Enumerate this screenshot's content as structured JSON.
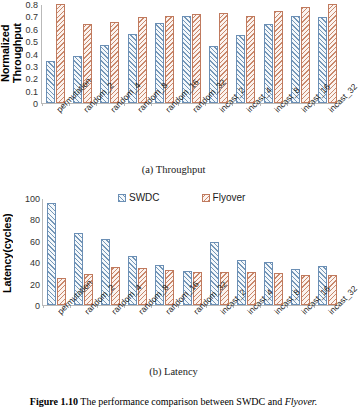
{
  "figure": {
    "caption_label": "Figure 1.10",
    "caption_text": "The performance comparison between SWDC and",
    "caption_emphasis": "Flyover."
  },
  "legend": {
    "items": [
      {
        "label": "SWDC",
        "color": "#6b8fb5"
      },
      {
        "label": "Flyover",
        "color": "#c07a5e"
      }
    ]
  },
  "panels": [
    {
      "subcaption": "(a) Throughput"
    },
    {
      "subcaption": "(b) Latency"
    }
  ],
  "chart_data": [
    {
      "type": "bar",
      "title": "(a) Throughput",
      "xlabel": "",
      "ylabel": "Normalized Throughput",
      "ylim": [
        0,
        0.8
      ],
      "yticks": [
        0,
        0.1,
        0.2,
        0.3,
        0.4,
        0.5,
        0.6,
        0.7,
        0.8
      ],
      "yticklabels": [
        "0",
        "0.1",
        "0.2",
        "0.3",
        "0.4",
        "0.5",
        "0.6",
        "0.7",
        "0.8"
      ],
      "grid": false,
      "legend_position": "none",
      "categories": [
        "permutation",
        "random_2",
        "random_4",
        "random_8",
        "random_16",
        "random_32",
        "incast_2",
        "incast_4",
        "incast_8",
        "incast_16",
        "incast_32"
      ],
      "series": [
        {
          "name": "SWDC",
          "color": "#6b8fb5",
          "values": [
            0.34,
            0.38,
            0.47,
            0.56,
            0.65,
            0.7,
            0.46,
            0.55,
            0.64,
            0.7,
            0.695
          ]
        },
        {
          "name": "Flyover",
          "color": "#c07a5e",
          "values": [
            0.8,
            0.64,
            0.655,
            0.695,
            0.7,
            0.72,
            0.73,
            0.7,
            0.745,
            0.775,
            0.8
          ]
        }
      ]
    },
    {
      "type": "bar",
      "title": "(b) Latency",
      "xlabel": "",
      "ylabel": "Latency(cycles)",
      "ylim": [
        0,
        100
      ],
      "yticks": [
        0,
        20,
        40,
        60,
        80,
        100
      ],
      "yticklabels": [
        "0",
        "20",
        "40",
        "60",
        "80",
        "100"
      ],
      "grid": false,
      "legend_position": "upper center",
      "categories": [
        "permutation",
        "random_2",
        "random_4",
        "random_8",
        "random_16",
        "random_32",
        "incast_2",
        "incast_4",
        "incast_8",
        "incast_16",
        "incast_32"
      ],
      "series": [
        {
          "name": "SWDC",
          "color": "#6b8fb5",
          "values": [
            95,
            67,
            62,
            46,
            37,
            32,
            58.5,
            42,
            40,
            33.5,
            36
          ]
        },
        {
          "name": "Flyover",
          "color": "#c07a5e",
          "values": [
            25,
            29,
            35.5,
            34.5,
            32.5,
            31,
            31,
            31,
            29.5,
            28.5,
            28.5
          ]
        }
      ]
    }
  ]
}
